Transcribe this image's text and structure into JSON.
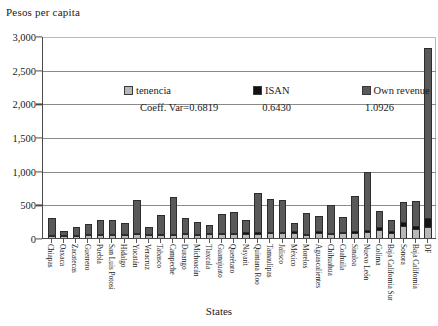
{
  "chart_data": {
    "type": "bar",
    "subtype": "stacked-bar",
    "title": "",
    "ylabel": "Pesos per capita",
    "xlabel": "States",
    "ylim": [
      0,
      3000
    ],
    "ytick_labels": [
      "3,000",
      "2,500",
      "2,000",
      "1,500",
      "1,000",
      "500",
      "0"
    ],
    "ytick_values": [
      3000,
      2500,
      2000,
      1500,
      1000,
      500,
      0
    ],
    "grid": true,
    "legend_position": "inside-top",
    "legend": [
      "tenencia",
      "ISAN",
      "Own revenue"
    ],
    "series_colors": [
      "#b8b8b8",
      "#121212",
      "#595959"
    ],
    "annotations": {
      "coeff_var_label": "Coeff. Var=0.6819",
      "coeff_var_values": [
        "0.6430",
        "1.0926"
      ]
    },
    "coeff_var": {
      "tenencia": 0.6819,
      "ISAN": 0.643,
      "own_revenue": 1.0926
    },
    "categories": [
      "Chiapas",
      "Oaxaca",
      "Zacatecas",
      "Guerrero",
      "Puebla",
      "San Luis Potosi",
      "Hidalgo",
      "Yucatán",
      "Veracruz",
      "Tabasco",
      "Campeche",
      "Durango",
      "Michoacán",
      "Tlaxcala",
      "Guanajuato",
      "Querétaro",
      "Nayarit",
      "Quintana Roo",
      "Tamaulipas",
      "Jalisco",
      "México",
      "Morelos",
      "Aguascalientes",
      "Chihuahua",
      "Coahuila",
      "Sinaloa",
      "Nuevo León",
      "Colima",
      "Baja California Sur",
      "Sonora",
      "Baja California",
      "DF"
    ],
    "series": [
      {
        "name": "tenencia",
        "values": [
          22,
          12,
          18,
          26,
          34,
          36,
          28,
          46,
          24,
          32,
          30,
          44,
          30,
          40,
          40,
          44,
          48,
          52,
          58,
          56,
          60,
          34,
          62,
          44,
          58,
          60,
          70,
          110,
          62,
          160,
          120,
          150
        ]
      },
      {
        "name": "ISAN",
        "values": [
          10,
          5,
          8,
          10,
          14,
          14,
          12,
          18,
          10,
          14,
          12,
          16,
          12,
          16,
          16,
          18,
          20,
          22,
          24,
          22,
          24,
          14,
          26,
          18,
          24,
          24,
          28,
          44,
          26,
          60,
          48,
          130
        ]
      },
      {
        "name": "Own revenue",
        "values": [
          248,
          58,
          119,
          159,
          202,
          200,
          170,
          486,
          116,
          284,
          554,
          220,
          182,
          116,
          290,
          312,
          188,
          580,
          486,
          470,
          126,
          302,
          228,
          412,
          220,
          522,
          862,
          226,
          162,
          300,
          362,
          2520
        ]
      }
    ],
    "totals": [
      280,
      75,
      145,
      195,
      250,
      250,
      210,
      550,
      150,
      330,
      596,
      280,
      224,
      172,
      346,
      374,
      256,
      654,
      568,
      548,
      210,
      350,
      316,
      474,
      302,
      606,
      960,
      380,
      250,
      520,
      530,
      2800
    ]
  }
}
